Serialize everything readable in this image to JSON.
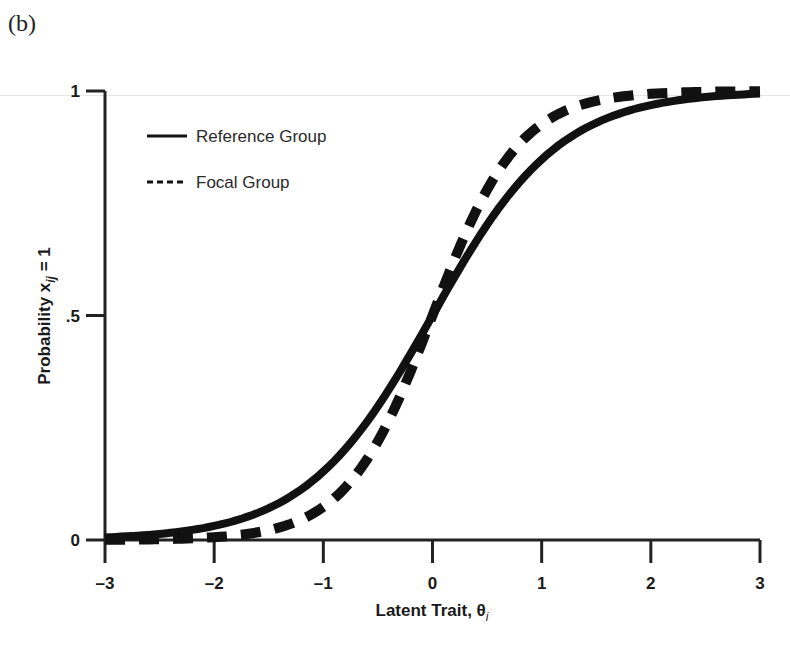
{
  "figure": {
    "panel_label": "(b)"
  },
  "chart_data": {
    "type": "line",
    "title": "",
    "xlabel": "Latent Trait, θ",
    "xlabel_subscript": "i",
    "ylabel": "Probability x",
    "ylabel_subscript": "ij",
    "ylabel_suffix": " = 1",
    "xlim": [
      -3,
      3
    ],
    "ylim": [
      0,
      1
    ],
    "x_ticks": [
      -3,
      -2,
      -1,
      0,
      1,
      2,
      3
    ],
    "x_tick_labels": [
      "–3",
      "–2",
      "–1",
      "0",
      "1",
      "2",
      "3"
    ],
    "y_ticks": [
      0,
      0.5,
      1
    ],
    "y_tick_labels": [
      "0",
      ".5",
      "1"
    ],
    "grid": false,
    "legend_position": "upper-left",
    "x": [
      -3,
      -2.5,
      -2,
      -1.5,
      -1,
      -0.5,
      0,
      0.5,
      1,
      1.5,
      2,
      2.5,
      3
    ],
    "series": [
      {
        "name": "Reference Group",
        "style": "solid",
        "model": {
          "a": 1.05,
          "b": 0.0
        },
        "values": [
          0.04,
          0.07,
          0.11,
          0.17,
          0.26,
          0.37,
          0.5,
          0.63,
          0.74,
          0.83,
          0.89,
          0.93,
          0.96
        ]
      },
      {
        "name": "Focal Group",
        "style": "dashed",
        "model": {
          "a": 1.55,
          "b": 0.0
        },
        "values": [
          0.01,
          0.02,
          0.04,
          0.09,
          0.18,
          0.32,
          0.5,
          0.68,
          0.82,
          0.91,
          0.96,
          0.98,
          0.99
        ]
      }
    ],
    "colors": {
      "line": "#111111",
      "axis": "#222222"
    }
  }
}
